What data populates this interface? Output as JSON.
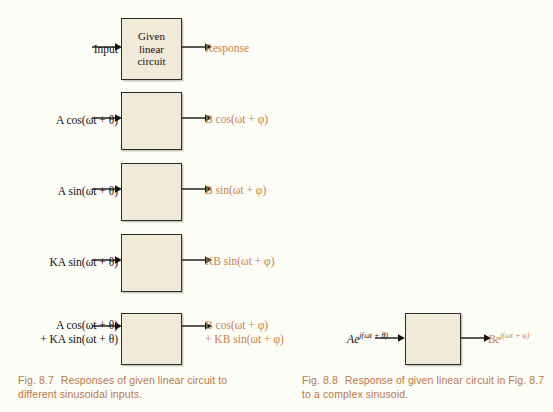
{
  "figure_left": {
    "id": "fig-8-7",
    "block_label": "Given\nlinear\ncircuit",
    "caption_number": "Fig. 8.7",
    "caption_text": "Responses of given linear circuit to different sinusoidal inputs.",
    "rows": [
      {
        "name": "generic",
        "input": "Input",
        "output": "Response",
        "input_line2": "",
        "output_line2": ""
      },
      {
        "name": "cosine",
        "input": "A cos(ωt + θ)",
        "output": "B cos(ωt + φ)",
        "input_line2": "",
        "output_line2": ""
      },
      {
        "name": "sine",
        "input": "A sin(ωt + θ)",
        "output": "B sin(ωt + φ)",
        "input_line2": "",
        "output_line2": ""
      },
      {
        "name": "scaled-sine",
        "input": "KA sin(ωt + θ)",
        "output": "KB sin(ωt + φ)",
        "input_line2": "",
        "output_line2": ""
      },
      {
        "name": "superposition",
        "input": "A cos(ωt + θ)",
        "input_line2": "+ KA sin(ωt + θ)",
        "output": "B cos(ωt + φ)",
        "output_line2": "+ KB sin(ωt + φ)"
      }
    ]
  },
  "figure_right": {
    "id": "fig-8-8",
    "caption_number": "Fig. 8.8",
    "caption_text": "Response of given linear circuit in Fig. 8.7 to a complex sinusoid.",
    "row": {
      "name": "complex-exponential",
      "input_base": "Ae",
      "input_exp": "j(ωt + θ)",
      "output_base": "Be",
      "output_exp": "j(ωt + φ)"
    }
  },
  "colors": {
    "page_background": "#fdfdf8",
    "block_fill": "#f1ead9",
    "block_border": "#2b2b2b",
    "input_text": "#17120e",
    "output_text": "#c8824a",
    "caption_text": "#b8794a"
  }
}
